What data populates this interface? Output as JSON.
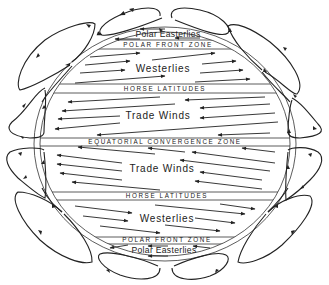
{
  "diagram": {
    "labels": {
      "polar_easterlies_north": "Polar Easterlies",
      "polar_front_zone_north": "POLAR FRONT ZONE",
      "westerlies_north": "Westerlies",
      "horse_latitudes_north": "HORSE LATITUDES",
      "trade_winds_north": "Trade Winds",
      "equatorial_convergence_zone": "EQUATORIAL CONVERGENCE ZONE",
      "trade_winds_south": "Trade Winds",
      "horse_latitudes_south": "HORSE LATITUDES",
      "westerlies_south": "Westerlies",
      "polar_front_zone_south": "POLAR FRONT ZONE",
      "polar_easterlies_south": "Polar Easterlies"
    },
    "zones": [
      {
        "name": "Polar Easterlies",
        "hemisphere": "north",
        "wind_direction": "west"
      },
      {
        "name": "Westerlies",
        "hemisphere": "north",
        "wind_direction": "east"
      },
      {
        "name": "Trade Winds",
        "hemisphere": "north",
        "wind_direction": "west"
      },
      {
        "name": "Trade Winds",
        "hemisphere": "south",
        "wind_direction": "west"
      },
      {
        "name": "Westerlies",
        "hemisphere": "south",
        "wind_direction": "east"
      },
      {
        "name": "Polar Easterlies",
        "hemisphere": "south",
        "wind_direction": "west"
      }
    ],
    "boundaries": [
      "POLAR FRONT ZONE",
      "HORSE LATITUDES",
      "EQUATORIAL CONVERGENCE ZONE",
      "HORSE LATITUDES",
      "POLAR FRONT ZONE"
    ],
    "circulation_cells_per_side": 6,
    "colors": {
      "ink": "#222222",
      "background": "#ffffff"
    }
  }
}
